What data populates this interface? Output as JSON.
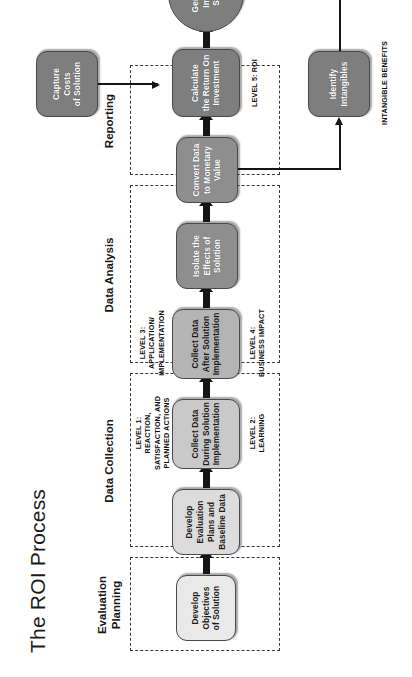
{
  "figure": {
    "title": "The ROI Process",
    "caption": "Figure 2-3.  The ROI methodology."
  },
  "phases": [
    {
      "id": "evaluation-planning",
      "label": "Evaluation\nPlanning"
    },
    {
      "id": "data-collection",
      "label": "Data Collection"
    },
    {
      "id": "data-analysis",
      "label": "Data Analysis"
    },
    {
      "id": "reporting",
      "label": "Reporting"
    }
  ],
  "nodes": [
    {
      "id": "develop-objectives",
      "label": "Develop\nObjectives\nof Solution",
      "shape": "rounded-rect",
      "shade": 1
    },
    {
      "id": "develop-evaluation-plans",
      "label": "Develop\nEvaluation\nPlans and\nBaseline Data",
      "shape": "rounded-rect",
      "shade": 2
    },
    {
      "id": "collect-data-during",
      "label": "Collect Data\nDuring Solution\nImplementation",
      "shape": "rounded-rect",
      "shade": 3
    },
    {
      "id": "collect-data-after",
      "label": "Collect Data\nAfter Solution\nImplementation",
      "shape": "rounded-rect",
      "shade": 4
    },
    {
      "id": "isolate-effects",
      "label": "Isolate the\nEffects of\nSolution",
      "shape": "rounded-rect",
      "shade": 5
    },
    {
      "id": "convert-data",
      "label": "Convert Data\nto Monetary\nValue",
      "shape": "rounded-rect",
      "shade": 5
    },
    {
      "id": "calculate-roi",
      "label": "Calculate\nthe Return On\nInvestment",
      "shape": "rounded-rect",
      "shade": 6
    },
    {
      "id": "generate-impact-study",
      "label": "Generate\nImpact\nStudy",
      "shape": "oval",
      "shade": 6
    },
    {
      "id": "capture-costs",
      "label": "Capture\nCosts\nof Solution",
      "shape": "rounded-rect",
      "shade": 6
    },
    {
      "id": "identify-intangibles",
      "label": "Identify\nIntangibles",
      "shape": "rounded-rect",
      "shade": 6
    }
  ],
  "level_notes": [
    {
      "id": "level-1",
      "label": "LEVEL 1:\nREACTION,\nSATISFACTION, AND\nPLANNED ACTIONS"
    },
    {
      "id": "level-2",
      "label": "LEVEL 2:\nLEARNING"
    },
    {
      "id": "level-3",
      "label": "LEVEL 3:\nAPPLICATION/\nIMPLEMENTATION"
    },
    {
      "id": "level-4",
      "label": "LEVEL 4:\nBUSINESS IMPACT"
    },
    {
      "id": "level-5",
      "label": "LEVEL 5:  ROI"
    },
    {
      "id": "intangible-benefits",
      "label": "INTANGIBLE BENEFITS"
    }
  ],
  "colors": {
    "ink": "#151515",
    "node_border": "#4a4a4a",
    "shade_1": "#e9e9e9",
    "shade_2": "#dcdcdc",
    "shade_3": "#c9c9c9",
    "shade_4": "#b4b4b4",
    "shade_5": "#8e8e8e",
    "shade_6": "#7e7e7e",
    "dashed": "#3b3b3b",
    "page": "#ffffff"
  }
}
